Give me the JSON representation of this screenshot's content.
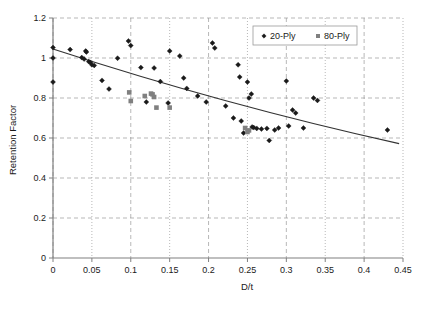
{
  "chart_data": {
    "type": "scatter",
    "title": "",
    "xlabel": "D/t",
    "ylabel": "Retention Factor",
    "xlim": [
      0,
      0.45
    ],
    "ylim": [
      0,
      1.2
    ],
    "xticks": [
      0,
      0.05,
      0.1,
      0.15,
      0.2,
      0.25,
      0.3,
      0.35,
      0.4,
      0.45
    ],
    "xtick_labels": [
      "0",
      "0.05",
      "0.1",
      "0.15",
      "0.2",
      "0.25",
      "0.3",
      "0.35",
      "0.4",
      "0.45"
    ],
    "yticks": [
      0,
      0.2,
      0.4,
      0.6,
      0.8,
      1,
      1.2
    ],
    "ytick_labels": [
      "0",
      "0.2",
      "0.4",
      "0.6",
      "0.8",
      "1",
      "1.2"
    ],
    "grid": true,
    "grid_style": "dashed",
    "legend_position": "top-right",
    "series": [
      {
        "name": "20-Ply",
        "marker": "diamond",
        "color": "#1a1a1a",
        "points": [
          [
            0.0,
            1.052
          ],
          [
            0.0,
            1.0
          ],
          [
            0.0,
            0.88
          ],
          [
            0.022,
            1.042
          ],
          [
            0.037,
            1.002
          ],
          [
            0.04,
            0.995
          ],
          [
            0.042,
            1.035
          ],
          [
            0.043,
            1.03
          ],
          [
            0.046,
            0.982
          ],
          [
            0.048,
            0.978
          ],
          [
            0.05,
            0.966
          ],
          [
            0.053,
            0.963
          ],
          [
            0.063,
            0.888
          ],
          [
            0.072,
            0.845
          ],
          [
            0.083,
            0.999
          ],
          [
            0.097,
            1.085
          ],
          [
            0.1,
            1.062
          ],
          [
            0.113,
            0.952
          ],
          [
            0.12,
            0.78
          ],
          [
            0.13,
            0.95
          ],
          [
            0.138,
            0.882
          ],
          [
            0.148,
            0.775
          ],
          [
            0.15,
            1.035
          ],
          [
            0.163,
            1.01
          ],
          [
            0.168,
            0.9
          ],
          [
            0.172,
            0.848
          ],
          [
            0.186,
            0.81
          ],
          [
            0.197,
            0.78
          ],
          [
            0.205,
            1.075
          ],
          [
            0.208,
            1.05
          ],
          [
            0.222,
            0.76
          ],
          [
            0.232,
            0.7
          ],
          [
            0.238,
            0.966
          ],
          [
            0.24,
            0.905
          ],
          [
            0.242,
            0.685
          ],
          [
            0.245,
            0.625
          ],
          [
            0.25,
            0.88
          ],
          [
            0.252,
            0.8
          ],
          [
            0.255,
            0.82
          ],
          [
            0.256,
            0.655
          ],
          [
            0.258,
            0.652
          ],
          [
            0.262,
            0.648
          ],
          [
            0.268,
            0.645
          ],
          [
            0.275,
            0.648
          ],
          [
            0.278,
            0.588
          ],
          [
            0.285,
            0.64
          ],
          [
            0.29,
            0.65
          ],
          [
            0.3,
            0.885
          ],
          [
            0.303,
            0.66
          ],
          [
            0.308,
            0.74
          ],
          [
            0.312,
            0.725
          ],
          [
            0.322,
            0.65
          ],
          [
            0.335,
            0.8
          ],
          [
            0.34,
            0.788
          ],
          [
            0.43,
            0.64
          ]
        ]
      },
      {
        "name": "80-Ply",
        "marker": "square",
        "color": "#808080",
        "points": [
          [
            0.098,
            0.828
          ],
          [
            0.1,
            0.785
          ],
          [
            0.118,
            0.81
          ],
          [
            0.126,
            0.822
          ],
          [
            0.128,
            0.818
          ],
          [
            0.13,
            0.805
          ],
          [
            0.133,
            0.752
          ],
          [
            0.15,
            0.752
          ],
          [
            0.247,
            0.65
          ],
          [
            0.25,
            0.63
          ],
          [
            0.252,
            0.638
          ]
        ]
      }
    ],
    "trendline": {
      "name": "trend",
      "color": "#333333",
      "x_start": 0.0,
      "y_start": 1.045,
      "x_end": 0.445,
      "y_end": 0.572,
      "curvature": "slightly concave up"
    }
  },
  "legend": {
    "entries": [
      {
        "label": "20-Ply",
        "marker": "diamond",
        "color": "#1a1a1a"
      },
      {
        "label": "80-Ply",
        "marker": "square",
        "color": "#808080"
      }
    ]
  },
  "axes": {
    "x_title": "D/t",
    "y_title": "Retention Factor"
  }
}
